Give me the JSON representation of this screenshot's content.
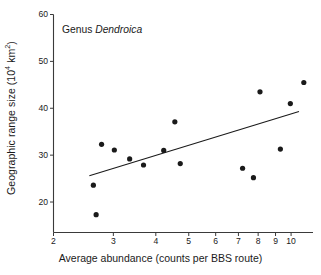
{
  "chart_data": {
    "type": "scatter",
    "title": "",
    "annotation": "Genus Dendroica",
    "annotation_plain": "Genus ",
    "annotation_italic": "Dendroica",
    "xlabel": "Average abundance (counts per BBS route)",
    "ylabel_text": "Geographic range size (10",
    "ylabel_sup": "4",
    "ylabel_tail": " km",
    "ylabel_sup2": "2",
    "ylabel_close": ")",
    "ylabel_full": "Geographic range size (10^4 km^2)",
    "xscale": "log",
    "yscale": "linear",
    "xlim": [
      2,
      11.6
    ],
    "ylim": [
      13.5,
      60
    ],
    "xticks": [
      2,
      3,
      4,
      5,
      6,
      7,
      8,
      9,
      10
    ],
    "xtick_labels": [
      "2",
      "3",
      "4",
      "5",
      "6",
      "7",
      "8",
      "9",
      "10"
    ],
    "yticks": [
      20,
      30,
      40,
      50,
      60
    ],
    "ytick_labels": [
      "20",
      "30",
      "40",
      "50",
      "60"
    ],
    "grid": false,
    "legend": null,
    "marker": {
      "shape": "circle",
      "color": "#1a1a1a",
      "size_px": 5.2
    },
    "points": [
      {
        "x": 2.62,
        "y": 23.6
      },
      {
        "x": 2.67,
        "y": 17.3
      },
      {
        "x": 2.77,
        "y": 32.3
      },
      {
        "x": 3.02,
        "y": 31.1
      },
      {
        "x": 3.35,
        "y": 29.2
      },
      {
        "x": 3.68,
        "y": 27.9
      },
      {
        "x": 4.22,
        "y": 31.0
      },
      {
        "x": 4.55,
        "y": 37.1
      },
      {
        "x": 4.72,
        "y": 28.2
      },
      {
        "x": 7.2,
        "y": 27.2
      },
      {
        "x": 7.75,
        "y": 25.2
      },
      {
        "x": 8.1,
        "y": 43.5
      },
      {
        "x": 9.3,
        "y": 31.3
      },
      {
        "x": 9.95,
        "y": 41.0
      },
      {
        "x": 10.9,
        "y": 45.5
      }
    ],
    "trendline": {
      "type": "linear-fit-on-log-x",
      "x_start": 2.55,
      "y_start": 25.6,
      "x_end": 10.55,
      "y_end": 39.3,
      "color": "#1a1a1a",
      "width_px": 1.1
    },
    "axis_color": "#3a3a3a",
    "background": "#ffffff"
  }
}
